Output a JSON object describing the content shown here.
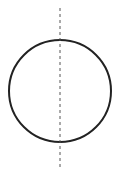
{
  "diagram": {
    "type": "geometry",
    "circle": {
      "cx": 60,
      "cy": 91,
      "r": 51,
      "stroke": "#222222",
      "stroke_width": 2
    },
    "axis": {
      "x": 60,
      "y1": 8,
      "y2": 170,
      "stroke": "#555555",
      "stroke_width": 1,
      "dash": "3,3"
    }
  }
}
